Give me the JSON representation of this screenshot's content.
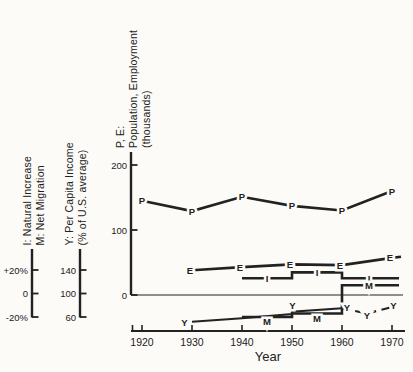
{
  "figure": {
    "background": "#fcfbf8",
    "ink": "#222222"
  },
  "chart_data": {
    "type": "line",
    "title": "",
    "xlabel": "Year",
    "x_ticks": [
      1920,
      1930,
      1940,
      1950,
      1960,
      1970
    ],
    "grid": false,
    "legend": "none; series identified by letter markers drawn on the lines",
    "vertical_axes": [
      {
        "id": "im",
        "title_lines": [
          "I: Natural Increase",
          "M: Net Migration"
        ],
        "ticks": [
          {
            "label": "+20%",
            "value": 20
          },
          {
            "label": "0",
            "value": 0
          },
          {
            "label": "-20%",
            "value": -20
          }
        ],
        "range": "-20% to +20%"
      },
      {
        "id": "income",
        "title_lines": [
          "Y: Per Capita Income",
          "(% of U.S. average)"
        ],
        "ticks": [
          {
            "label": "140",
            "value": 140
          },
          {
            "label": "100",
            "value": 100
          },
          {
            "label": "60",
            "value": 60
          }
        ],
        "range": "60 to 140"
      },
      {
        "id": "pe",
        "title_lines": [
          "P, E:",
          "Population, Employment",
          "(thousands)"
        ],
        "ticks": [
          {
            "label": "200",
            "value": 200
          },
          {
            "label": "100",
            "value": 100
          },
          {
            "label": "0",
            "value": 0
          }
        ],
        "range": "0 to 200"
      }
    ],
    "series": [
      {
        "id": "P",
        "marker": "P",
        "meaning": "Population (thousands)",
        "axis": "pe",
        "line": "solid",
        "points": [
          [
            1920,
            145
          ],
          [
            1930,
            129
          ],
          [
            1940,
            151
          ],
          [
            1950,
            137
          ],
          [
            1960,
            130
          ],
          [
            1970,
            160
          ]
        ]
      },
      {
        "id": "E",
        "marker": "E",
        "meaning": "Employment (thousands)",
        "axis": "pe",
        "line": "solid",
        "points": [
          [
            1930,
            38
          ],
          [
            1940,
            43
          ],
          [
            1950,
            47
          ],
          [
            1960,
            46
          ],
          [
            1970,
            57
          ]
        ]
      },
      {
        "id": "I",
        "marker": "I",
        "meaning": "Natural Increase (% per decade)",
        "axis": "im",
        "line": "step",
        "steps": [
          [
            1940,
            1950,
            13
          ],
          [
            1950,
            1960,
            18
          ],
          [
            1960,
            1970,
            13
          ]
        ]
      },
      {
        "id": "M",
        "marker": "M",
        "meaning": "Net Migration (% per decade)",
        "axis": "im",
        "line": "step",
        "steps": [
          [
            1940,
            1950,
            -20
          ],
          [
            1950,
            1960,
            -17
          ],
          [
            1960,
            1970,
            7
          ]
        ]
      },
      {
        "id": "Y",
        "marker": "Y",
        "meaning": "Per Capita Income (% of U.S. average)",
        "axis": "income",
        "line": "solid",
        "points": [
          [
            1930,
            52
          ],
          [
            1940,
            58
          ],
          [
            1950,
            65
          ],
          [
            1950,
            69
          ],
          [
            1960,
            75
          ]
        ]
      },
      {
        "id": "Y-dashed",
        "marker": "Y",
        "meaning": "Per Capita Income (% of U.S. average), dashed segment",
        "axis": "income",
        "line": "dashed",
        "points": [
          [
            1960,
            75
          ],
          [
            1965,
            66
          ],
          [
            1970,
            77
          ]
        ]
      }
    ]
  }
}
